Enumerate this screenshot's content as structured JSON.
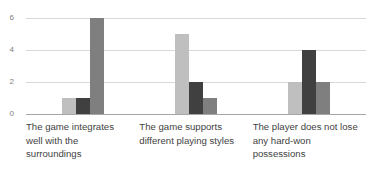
{
  "chart_data": {
    "type": "bar",
    "title": "",
    "subtitle": "",
    "xlabel": "",
    "ylabel": "",
    "ylim": [
      0,
      6
    ],
    "yticks": [
      0,
      2,
      4,
      6
    ],
    "ytick_labels": [
      "0",
      "2",
      "4",
      "6"
    ],
    "grid": true,
    "legend": "none",
    "categories": [
      "The game integrates well with the surroundings",
      "The game supports different playing styles",
      "The player does not lose any hard-won possessions"
    ],
    "series": [
      {
        "name": "series-1",
        "color": "#bfbfbf",
        "values": [
          1,
          5,
          2
        ]
      },
      {
        "name": "series-2",
        "color": "#404040",
        "values": [
          1,
          2,
          4
        ]
      },
      {
        "name": "series-3",
        "color": "#7f7f7f",
        "values": [
          6,
          1,
          2
        ]
      }
    ]
  }
}
